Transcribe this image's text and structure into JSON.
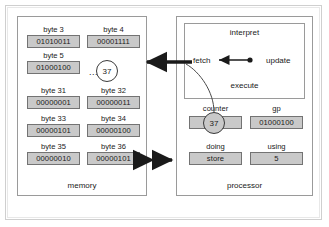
{
  "diagram": {
    "memory": {
      "title": "memory",
      "ellipsis": "...",
      "pointer_value": "37",
      "bytes": [
        {
          "label": "byte 3",
          "value": "01010011"
        },
        {
          "label": "byte 4",
          "value": "00001111"
        },
        {
          "label": "byte 5",
          "value": "01000100"
        },
        {
          "label": "byte 31",
          "value": "00000001"
        },
        {
          "label": "byte 32",
          "value": "00000011"
        },
        {
          "label": "byte 33",
          "value": "00000101"
        },
        {
          "label": "byte 34",
          "value": "00000100"
        },
        {
          "label": "byte 35",
          "value": "00000010"
        },
        {
          "label": "byte 36",
          "value": "00000101"
        }
      ]
    },
    "processor": {
      "title": "processor",
      "interpret": {
        "title": "interpret",
        "fetch": "fetch",
        "update": "update",
        "execute": "execute"
      },
      "registers": [
        {
          "label": "counter",
          "value": "37"
        },
        {
          "label": "gp",
          "value": "01000100"
        },
        {
          "label": "doing",
          "value": "store"
        },
        {
          "label": "using",
          "value": "5"
        }
      ]
    },
    "colors": {
      "cell_fill": "#c9c9c9",
      "cell_border": "#737373",
      "panel_border": "#9a9a9a",
      "arrow": "#1a1a1a",
      "frame_outer": "#cfcfcf",
      "frame_inner": "#e8e8e8",
      "background": "#ffffff",
      "text": "#1a1a1a"
    }
  }
}
